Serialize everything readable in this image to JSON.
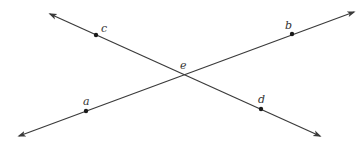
{
  "diagram": {
    "colors": {
      "line": "#3a3a3a",
      "point": "#1a1a1a",
      "label": "#333333",
      "background": "#ffffff"
    },
    "lines": [
      {
        "id": "line-cd",
        "through": [
          "c",
          "e",
          "d"
        ],
        "start": [
          50,
          14
        ],
        "end": [
          320,
          136
        ],
        "arrows": "both"
      },
      {
        "id": "line-ab",
        "through": [
          "a",
          "e",
          "b"
        ],
        "start": [
          19,
          136
        ],
        "end": [
          354,
          12
        ],
        "arrows": "both"
      }
    ],
    "points": {
      "a": {
        "label": "a",
        "x": 86,
        "y": 111,
        "label_x": 83,
        "label_y": 105
      },
      "b": {
        "label": "b",
        "x": 292,
        "y": 34,
        "label_x": 285,
        "label_y": 29
      },
      "c": {
        "label": "c",
        "x": 96,
        "y": 35,
        "label_x": 101,
        "label_y": 32
      },
      "d": {
        "label": "d",
        "x": 261,
        "y": 109,
        "label_x": 258,
        "label_y": 103
      },
      "e": {
        "label": "e",
        "x": 183,
        "y": 74,
        "label_x": 180,
        "label_y": 69
      }
    }
  }
}
